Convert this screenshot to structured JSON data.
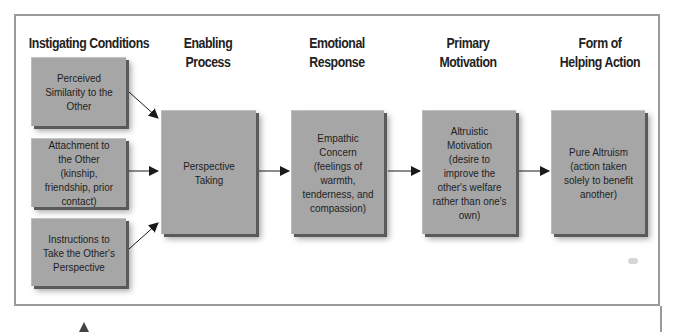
{
  "diagram": {
    "columns": [
      {
        "id": "instigating",
        "title": "Instigating Conditions"
      },
      {
        "id": "enabling",
        "title_line1": "Enabling",
        "title_line2": "Process"
      },
      {
        "id": "emotional",
        "title_line1": "Emotional",
        "title_line2": "Response"
      },
      {
        "id": "motivation",
        "title_line1": "Primary",
        "title_line2": "Motivation"
      },
      {
        "id": "action",
        "title_line1": "Form of",
        "title_line2": "Helping Action"
      }
    ],
    "nodes": {
      "perceived_similarity": "Perceived Similarity to the Other",
      "attachment": "Attachment to the Other (kinship, friendship, prior contact)",
      "instructions": "Instructions to Take the Other's Perspective",
      "perspective_taking": "Perspective Taking",
      "empathic_concern": "Empathic Concern (feelings of warmth, tenderness, and compassion)",
      "altruistic_motivation": "Altruistic Motivation (desire to improve the other's welfare rather than one's own)",
      "pure_altruism": "Pure Altruism (action taken solely to benefit another)"
    },
    "edges": [
      {
        "from": "perceived_similarity",
        "to": "perspective_taking"
      },
      {
        "from": "attachment",
        "to": "perspective_taking"
      },
      {
        "from": "instructions",
        "to": "perspective_taking"
      },
      {
        "from": "perspective_taking",
        "to": "empathic_concern"
      },
      {
        "from": "empathic_concern",
        "to": "altruistic_motivation"
      },
      {
        "from": "altruistic_motivation",
        "to": "pure_altruism"
      }
    ],
    "colors": {
      "box_fill": "#a6a6a6",
      "box_shadow": "#5a5a5a",
      "frame": "#9a9a9a",
      "arrow": "#1a1a1a"
    }
  }
}
